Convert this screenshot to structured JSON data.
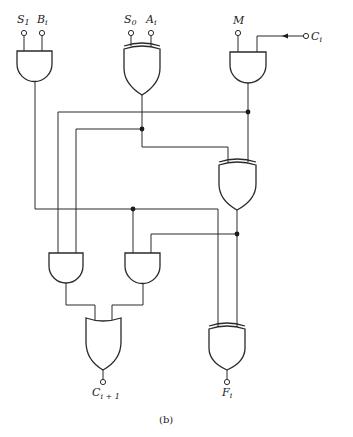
{
  "diagram": {
    "type": "logic-circuit",
    "caption": "(b)",
    "inputs": [
      {
        "id": "S1",
        "label": "S",
        "sub": "1"
      },
      {
        "id": "Bi",
        "label": "B",
        "sub": "i"
      },
      {
        "id": "S0",
        "label": "S",
        "sub": "0"
      },
      {
        "id": "Ai",
        "label": "A",
        "sub": "i"
      },
      {
        "id": "M",
        "label": "M",
        "sub": ""
      },
      {
        "id": "Ci",
        "label": "C",
        "sub": "i"
      }
    ],
    "outputs": [
      {
        "id": "Ci+1",
        "label": "C",
        "sub": "i + 1"
      },
      {
        "id": "Fi",
        "label": "F",
        "sub": "i"
      }
    ],
    "gates": [
      {
        "id": "and1",
        "type": "AND",
        "inputs": [
          "S1",
          "Bi"
        ]
      },
      {
        "id": "xor1",
        "type": "XOR",
        "inputs": [
          "S0",
          "Ai"
        ]
      },
      {
        "id": "and2",
        "type": "AND",
        "inputs": [
          "M",
          "Ci"
        ]
      },
      {
        "id": "xor2",
        "type": "XOR",
        "inputs": [
          "xor1",
          "and2"
        ]
      },
      {
        "id": "and3",
        "type": "AND",
        "inputs": [
          "and2",
          "xor1"
        ]
      },
      {
        "id": "and4",
        "type": "AND",
        "inputs": [
          "and1",
          "xor2"
        ]
      },
      {
        "id": "or1",
        "type": "OR",
        "inputs": [
          "and3",
          "and4"
        ]
      },
      {
        "id": "xor3",
        "type": "XOR",
        "inputs": [
          "and1",
          "xor2"
        ]
      }
    ]
  }
}
